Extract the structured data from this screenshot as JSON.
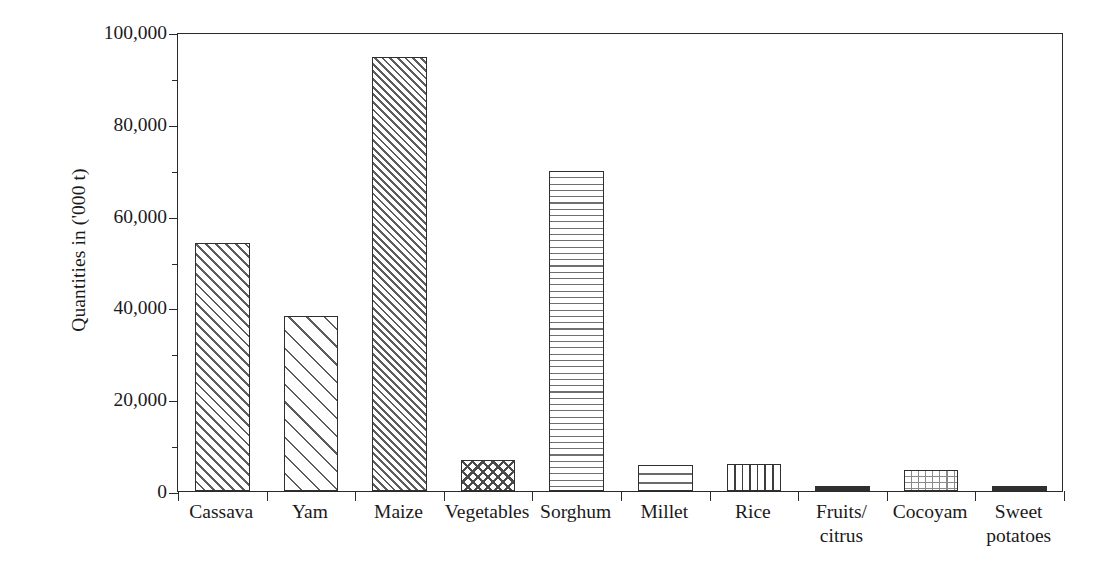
{
  "chart_data": {
    "type": "bar",
    "title": "",
    "xlabel": "",
    "ylabel": "Quantities in ('000 t)",
    "ylim": [
      0,
      100000
    ],
    "ytick_values": [
      0,
      20000,
      40000,
      60000,
      80000,
      100000
    ],
    "ytick_labels": [
      "0",
      "20,000",
      "40,000",
      "60,000",
      "80,000",
      "100,000"
    ],
    "yminor_values": [
      10000,
      30000,
      50000,
      70000,
      90000
    ],
    "grid": false,
    "legend": "none",
    "frame": true,
    "categories": [
      "Cassava",
      "Yam",
      "Maize",
      "Vegetables",
      "Sorghum",
      "Millet",
      "Rice",
      "Fruits/\ncitrus",
      "Cocoyam",
      "Sweet\npotatoes"
    ],
    "values": [
      54000,
      38200,
      94500,
      6800,
      69800,
      5700,
      5900,
      1000,
      4600,
      1200
    ],
    "bar_patterns": [
      "diag-medium",
      "diag-sparse",
      "diag-dense",
      "crosshatch",
      "horizontal",
      "horizontal-wide",
      "vertical",
      "solid",
      "grid",
      "solid"
    ]
  },
  "colors": {
    "axis": "#2a2a2a",
    "bar_outline": "#2f2f2f",
    "hatch": "#5d5d5d",
    "background": "#ffffff"
  }
}
